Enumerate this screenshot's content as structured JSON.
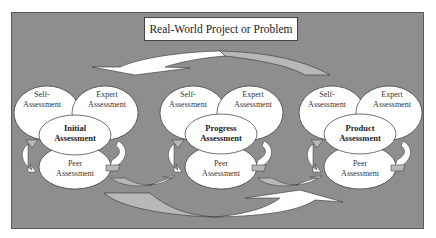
{
  "title": "Real-World Project or Problem",
  "clusters": [
    {
      "center": "Initial\nAssessment",
      "self": "Self-\nAssessment",
      "expert": "Expert\nAssessment",
      "peer": "Peer\nAssessment"
    },
    {
      "center": "Progress\nAssessment",
      "self": "Self-\nAssessment",
      "expert": "Expert\nAssessment",
      "peer": "Peer\nAssessment"
    },
    {
      "center": "Product\nAssessment",
      "self": "Self-\nAssessment",
      "expert": "Expert\nAssessment",
      "peer": "Peer\nAssessment"
    }
  ],
  "colors": {
    "panel": "#8e8e8e",
    "ellipse_fill": "#ffffff",
    "arrow_light": "#ffffff",
    "arrow_gray": "#b8b8b8"
  }
}
